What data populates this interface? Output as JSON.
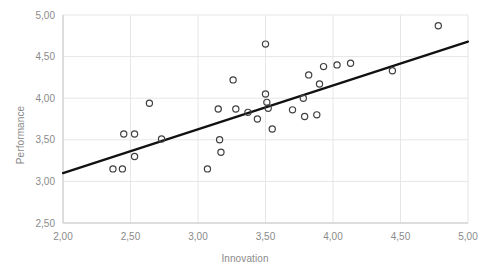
{
  "chart_data": {
    "type": "scatter",
    "title": "",
    "xlabel": "Innovation",
    "ylabel": "Performance",
    "xlim": [
      2.0,
      5.0
    ],
    "ylim": [
      2.5,
      5.0
    ],
    "xticks": [
      "2,00",
      "2,50",
      "3,00",
      "3,50",
      "4,00",
      "4,50",
      "5,00"
    ],
    "xtick_values": [
      2.0,
      2.5,
      3.0,
      3.5,
      4.0,
      4.5,
      5.0
    ],
    "yticks": [
      "2,50",
      "3,00",
      "3,50",
      "4,00",
      "4,50",
      "5,00"
    ],
    "ytick_values": [
      2.5,
      3.0,
      3.5,
      4.0,
      4.5,
      5.0
    ],
    "grid": true,
    "grid_axis": "both",
    "legend": "none",
    "marker": "open-circle",
    "marker_color": "#404040",
    "grid_color": "#e6e6e6",
    "axis_color": "#c8c8c8",
    "tick_label_color": "#8a8a8a",
    "points": [
      {
        "x": 2.37,
        "y": 3.15
      },
      {
        "x": 2.44,
        "y": 3.15
      },
      {
        "x": 2.45,
        "y": 3.57
      },
      {
        "x": 2.53,
        "y": 3.57
      },
      {
        "x": 2.53,
        "y": 3.3
      },
      {
        "x": 2.64,
        "y": 3.94
      },
      {
        "x": 2.73,
        "y": 3.51
      },
      {
        "x": 3.07,
        "y": 3.15
      },
      {
        "x": 3.16,
        "y": 3.5
      },
      {
        "x": 3.17,
        "y": 3.35
      },
      {
        "x": 3.15,
        "y": 3.87
      },
      {
        "x": 3.26,
        "y": 4.22
      },
      {
        "x": 3.28,
        "y": 3.87
      },
      {
        "x": 3.37,
        "y": 3.83
      },
      {
        "x": 3.44,
        "y": 3.75
      },
      {
        "x": 3.5,
        "y": 4.65
      },
      {
        "x": 3.5,
        "y": 4.05
      },
      {
        "x": 3.51,
        "y": 3.95
      },
      {
        "x": 3.52,
        "y": 3.88
      },
      {
        "x": 3.55,
        "y": 3.63
      },
      {
        "x": 3.7,
        "y": 3.86
      },
      {
        "x": 3.78,
        "y": 4.0
      },
      {
        "x": 3.79,
        "y": 3.78
      },
      {
        "x": 3.82,
        "y": 4.28
      },
      {
        "x": 3.88,
        "y": 3.8
      },
      {
        "x": 3.9,
        "y": 4.17
      },
      {
        "x": 3.93,
        "y": 4.38
      },
      {
        "x": 4.03,
        "y": 4.4
      },
      {
        "x": 4.13,
        "y": 4.42
      },
      {
        "x": 4.44,
        "y": 4.33
      },
      {
        "x": 4.78,
        "y": 4.87
      }
    ],
    "trendline": {
      "type": "linear",
      "x1": 2.0,
      "y1": 3.1,
      "x2": 5.0,
      "y2": 4.68,
      "color": "#111111",
      "width": 2.2
    }
  }
}
